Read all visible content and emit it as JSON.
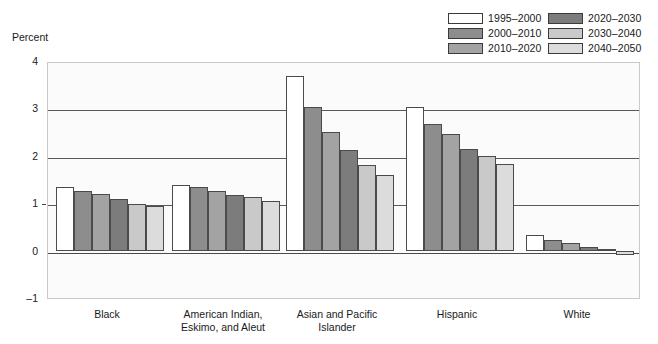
{
  "axis_title": "Percent",
  "legend": {
    "items": [
      {
        "label": "1995–2000",
        "color": "#ffffff"
      },
      {
        "label": "2020–2030",
        "color": "#7c7c7c"
      },
      {
        "label": "2000–2010",
        "color": "#8d8d8d"
      },
      {
        "label": "2030–2040",
        "color": "#c9c9c9"
      },
      {
        "label": "2010–2020",
        "color": "#a3a3a3"
      },
      {
        "label": "2040–2050",
        "color": "#dcdcdc"
      }
    ]
  },
  "chart_data": {
    "type": "bar",
    "title": "",
    "xlabel": "",
    "ylabel": "Percent",
    "ylim": [
      -1,
      4
    ],
    "yticks": [
      "4",
      "3",
      "2",
      "1",
      "0",
      "–1"
    ],
    "grid": true,
    "legend_position": "top-right",
    "categories": [
      "Black",
      "American Indian, Eskimo, and Aleut",
      "Asian and Pacific Islander",
      "Hispanic",
      "White"
    ],
    "category_lines": [
      [
        "Black"
      ],
      [
        "American Indian,",
        "Eskimo, and Aleut"
      ],
      [
        "Asian and Pacific",
        "Islander"
      ],
      [
        "Hispanic"
      ],
      [
        "White"
      ]
    ],
    "series": [
      {
        "name": "1995–2000",
        "color": "#ffffff",
        "values": [
          1.35,
          1.38,
          3.68,
          3.02,
          0.33
        ]
      },
      {
        "name": "2000–2010",
        "color": "#8d8d8d",
        "values": [
          1.25,
          1.35,
          3.02,
          2.68,
          0.22
        ]
      },
      {
        "name": "2010–2020",
        "color": "#a3a3a3",
        "values": [
          1.2,
          1.25,
          2.5,
          2.45,
          0.17
        ]
      },
      {
        "name": "2020–2030",
        "color": "#7c7c7c",
        "values": [
          1.08,
          1.18,
          2.12,
          2.15,
          0.08
        ]
      },
      {
        "name": "2030–2040",
        "color": "#c9c9c9",
        "values": [
          0.98,
          1.13,
          1.8,
          2.0,
          0.02
        ]
      },
      {
        "name": "2040–2050",
        "color": "#dcdcdc",
        "values": [
          0.95,
          1.05,
          1.6,
          1.82,
          -0.1
        ]
      }
    ]
  }
}
